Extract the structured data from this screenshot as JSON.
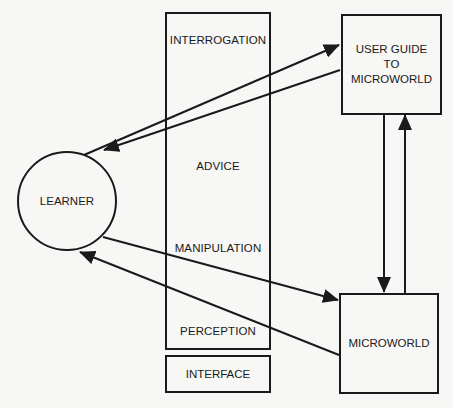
{
  "diagram": {
    "learner": {
      "label": "LEARNER"
    },
    "interface_column": {
      "sections": [
        {
          "label": "INTERROGATION"
        },
        {
          "label": "ADVICE"
        },
        {
          "label": "MANIPULATION"
        },
        {
          "label": "PERCEPTION"
        }
      ],
      "caption": "INTERFACE"
    },
    "user_guide": {
      "line1": "USER GUIDE",
      "line2": "TO",
      "line3": "MICROWORLD"
    },
    "microworld": {
      "label": "MICROWORLD"
    },
    "connections": [
      {
        "from": "LEARNER",
        "to": "USER GUIDE TO MICROWORLD"
      },
      {
        "from": "USER GUIDE TO MICROWORLD",
        "to": "LEARNER"
      },
      {
        "from": "LEARNER",
        "to": "MICROWORLD"
      },
      {
        "from": "MICROWORLD",
        "to": "LEARNER"
      },
      {
        "from": "USER GUIDE TO MICROWORLD",
        "to": "MICROWORLD"
      },
      {
        "from": "MICROWORLD",
        "to": "USER GUIDE TO MICROWORLD"
      }
    ],
    "colors": {
      "line": "#1a1a1a",
      "background": "#f7f7f5"
    }
  }
}
